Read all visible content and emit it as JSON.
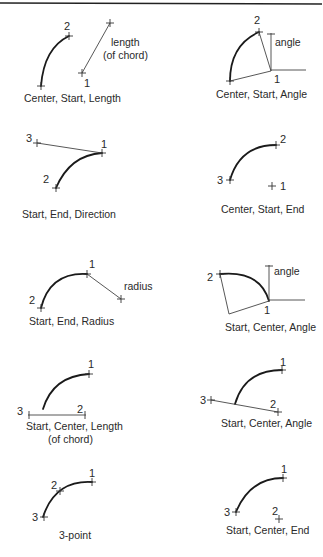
{
  "figure": {
    "panels": [
      {
        "id": "center-start-length",
        "caption": "Center, Start, Length",
        "points": [
          "1",
          "2"
        ],
        "annotations": [
          "length",
          "(of chord)"
        ]
      },
      {
        "id": "center-start-angle",
        "caption": "Center, Start, Angle",
        "points": [
          "1",
          "2"
        ],
        "annotations": [
          "angle"
        ]
      },
      {
        "id": "start-end-direction",
        "caption": "Start, End, Direction",
        "points": [
          "1",
          "2",
          "3"
        ],
        "annotations": []
      },
      {
        "id": "center-start-end",
        "caption": "Center, Start, End",
        "points": [
          "1",
          "2",
          "3"
        ],
        "annotations": []
      },
      {
        "id": "start-end-radius",
        "caption": "Start, End, Radius",
        "points": [
          "1",
          "2"
        ],
        "annotations": [
          "radius"
        ]
      },
      {
        "id": "start-center-angle-a",
        "caption": "Start, Center, Angle",
        "points": [
          "1",
          "2"
        ],
        "annotations": [
          "angle"
        ]
      },
      {
        "id": "start-center-length",
        "caption": "Start, Center, Length",
        "caption2": "(of chord)",
        "points": [
          "1",
          "2",
          "3"
        ],
        "annotations": []
      },
      {
        "id": "start-center-angle-b",
        "caption": "Start, Center, Angle",
        "points": [
          "1",
          "2",
          "3"
        ],
        "annotations": []
      },
      {
        "id": "three-point",
        "caption": "3-point",
        "points": [
          "1",
          "2",
          "3"
        ],
        "annotations": []
      },
      {
        "id": "start-center-end",
        "caption": "Start, Center, End",
        "points": [
          "1",
          "2",
          "3"
        ],
        "annotations": []
      }
    ]
  }
}
